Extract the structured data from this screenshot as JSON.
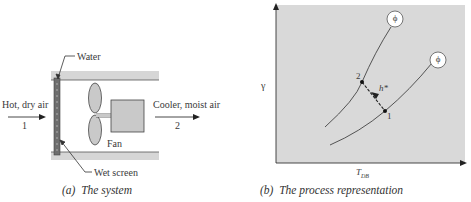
{
  "panel_a": {
    "caption_letter": "(a)",
    "caption_text": "The system",
    "labels": {
      "water": "Water",
      "inlet": "Hot, dry air",
      "inlet_state": "1",
      "outlet": "Cooler, moist air",
      "outlet_state": "2",
      "fan": "Fan",
      "wet_screen": "Wet screen"
    }
  },
  "panel_b": {
    "caption_letter": "(b)",
    "caption_text": "The process representation",
    "y_axis_label": "γ",
    "x_axis_label": "T",
    "x_axis_subscript": "DB",
    "curve_label": "ϕ",
    "point_1": "1",
    "point_2": "2",
    "process_label": "h*"
  },
  "colors": {
    "plot_background": "#d9d9d9",
    "duct": "#d6d6d6",
    "screen": "#6e6e6e",
    "fan": "#c9c9c9",
    "stroke": "#3a3a3a"
  }
}
